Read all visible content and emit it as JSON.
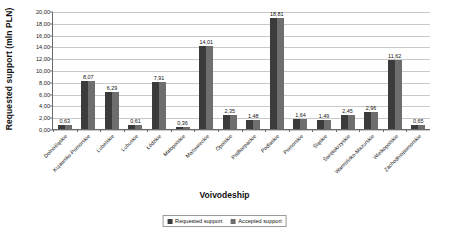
{
  "chart_data": {
    "type": "bar",
    "title": "",
    "xlabel": "Voivodeship",
    "ylabel": "Requested support (mln PLN)",
    "ylim": [
      0,
      20
    ],
    "ytick_step": 2,
    "ytick_labels": [
      "0,00",
      "2,00",
      "4,00",
      "6,00",
      "8,00",
      "10,00",
      "12,00",
      "14,00",
      "16,00",
      "18,00",
      "20,00"
    ],
    "grid": true,
    "legend_position": "bottom",
    "categories": [
      "Dolnośląskie",
      "Kujawsko-Pomorskie",
      "Lubelskie",
      "Lubuskie",
      "Łódzkie",
      "Małopolskie",
      "Mazowieckie",
      "Opolskie",
      "Podkarpackie",
      "Podlaskie",
      "Pomorskie",
      "Śląskie",
      "Świętokrzyskie",
      "Warmińsko-Mazurskie",
      "Wielkopolskie",
      "Zachodniopomorskie"
    ],
    "series": [
      {
        "name": "Requested support",
        "color": "#3b3b3b",
        "values": [
          0.63,
          8.07,
          6.29,
          0.61,
          7.91,
          0.36,
          14.01,
          2.35,
          1.48,
          18.81,
          1.64,
          1.49,
          2.45,
          2.96,
          11.62,
          0.65
        ]
      },
      {
        "name": "Accepted support",
        "color": "#6e6e6e",
        "values": [
          0.63,
          8.07,
          6.29,
          0.61,
          7.91,
          0.36,
          14.01,
          2.35,
          1.48,
          18.81,
          1.64,
          1.49,
          2.45,
          2.96,
          11.62,
          0.65
        ]
      }
    ],
    "data_labels": [
      "0,63",
      "8,07",
      "6,29",
      "0,61",
      "7,91",
      "0,36",
      "14,01",
      "2,35",
      "1,48",
      "18,81",
      "1,64",
      "1,49",
      "2,45",
      "2,96",
      "11,62",
      "0,65"
    ]
  },
  "legend": {
    "items": [
      {
        "label": "Requested support"
      },
      {
        "label": "Accepted support"
      }
    ]
  }
}
